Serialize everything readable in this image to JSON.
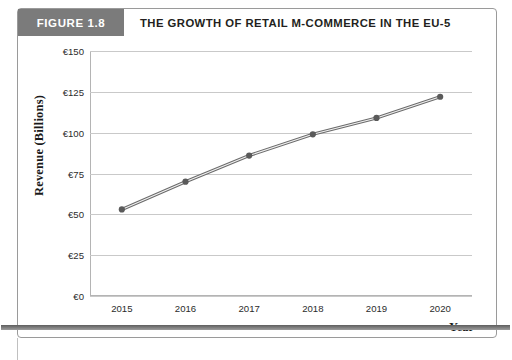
{
  "figure": {
    "number_label": "FIGURE 1.8",
    "title": "THE GROWTH OF RETAIL M-COMMERCE IN THE EU-5",
    "header_bg": "#7b7b7b",
    "header_text_color": "#ffffff"
  },
  "chart_data": {
    "type": "line",
    "title": "THE GROWTH OF RETAIL M-COMMERCE IN THE EU-5",
    "xlabel": "Year",
    "ylabel": "Revenue (Billions)",
    "categories": [
      "2015",
      "2016",
      "2017",
      "2018",
      "2019",
      "2020"
    ],
    "values": [
      53,
      70,
      86,
      99,
      109,
      122
    ],
    "ylim": [
      0,
      150
    ],
    "ytick_values": [
      0,
      25,
      50,
      75,
      100,
      125,
      150
    ],
    "ytick_labels": [
      "€0",
      "€25",
      "€50",
      "€75",
      "€100",
      "€125",
      "€150"
    ],
    "xtick_labels": [
      "2015",
      "2016",
      "2017",
      "2018",
      "2019",
      "2020"
    ],
    "grid": true,
    "grid_axis": "y",
    "legend": false,
    "series_color": "#6b6b6b",
    "marker_color": "#5a5a5a",
    "gridline_color": "#c9c9c9",
    "axis_color": "#b4b4b4"
  }
}
